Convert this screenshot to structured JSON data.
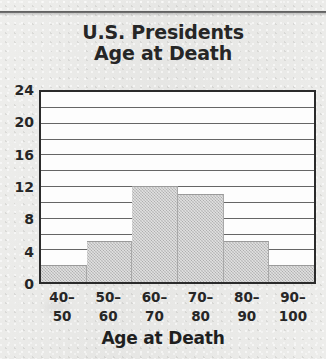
{
  "page": {
    "background_color": "#e9e9e7",
    "rule_color": "#3d3d3d"
  },
  "title": {
    "line1": "U.S. Presidents",
    "line2": "Age at Death"
  },
  "chart_data": {
    "type": "bar",
    "title": "U.S. Presidents Age at Death",
    "xlabel": "Age at Death",
    "ylabel": "",
    "categories": [
      "40–\n50",
      "50–\n60",
      "60–\n70",
      "70–\n80",
      "80–\n90",
      "90–\n100"
    ],
    "category_lines": [
      {
        "top": "40–",
        "bottom": "50"
      },
      {
        "top": "50–",
        "bottom": "60"
      },
      {
        "top": "60–",
        "bottom": "70"
      },
      {
        "top": "70–",
        "bottom": "80"
      },
      {
        "top": "80–",
        "bottom": "90"
      },
      {
        "top": "90–",
        "bottom": "100"
      }
    ],
    "values": [
      2,
      5,
      12,
      11,
      5,
      2
    ],
    "ylim": [
      0,
      24
    ],
    "ytick_labels": [
      "24",
      "20",
      "16",
      "12",
      "8",
      "4",
      "0"
    ],
    "ytick_values": [
      24,
      20,
      16,
      12,
      8,
      4,
      0
    ],
    "gridline_interval": 2,
    "grid": true,
    "legend": null,
    "bar_color": "#bdbdbd",
    "axis_color": "#2b2b2b",
    "plot_background": "#fdfdfd"
  }
}
